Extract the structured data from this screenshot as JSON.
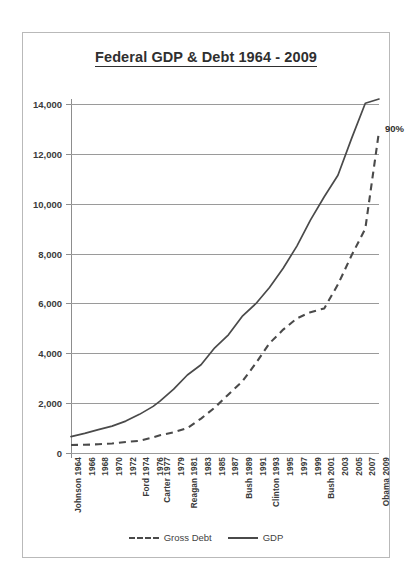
{
  "chart_data": {
    "type": "line",
    "title": "Federal GDP & Debt 1964 - 2009",
    "xlabel": "",
    "ylabel": "",
    "ylim": [
      0,
      14000
    ],
    "yticks": [
      0,
      2000,
      4000,
      6000,
      8000,
      10000,
      12000,
      14000
    ],
    "ytick_labels": [
      "0",
      "2,000",
      "4,000",
      "6,000",
      "8,000",
      "10,000",
      "12,000",
      "14,000"
    ],
    "grid": true,
    "legend_position": "bottom",
    "categories": [
      "Johnson 1964",
      "1966",
      "1968",
      "1970",
      "1972",
      "Ford 1974",
      "1976",
      "Carter 1977",
      "1979",
      "Reagan 1981",
      "1983",
      "1985",
      "1987",
      "Bush 1989",
      "1991",
      "Clinton 1993",
      "1995",
      "1997",
      "1999",
      "Bush 2001",
      "2003",
      "2005",
      "2007",
      "Obama 2009"
    ],
    "x": [
      1964,
      1966,
      1968,
      1970,
      1972,
      1974,
      1976,
      1977,
      1979,
      1981,
      1983,
      1985,
      1987,
      1989,
      1991,
      1993,
      1995,
      1997,
      1999,
      2001,
      2003,
      2005,
      2007,
      2009
    ],
    "series": [
      {
        "name": "Gross Debt",
        "style": "dashed",
        "color": "#4a4a4a",
        "values": [
          320,
          330,
          350,
          380,
          440,
          490,
          630,
          710,
          830,
          1000,
          1380,
          1820,
          2350,
          2860,
          3600,
          4400,
          4950,
          5400,
          5650,
          5800,
          6760,
          7930,
          9000,
          12900
        ]
      },
      {
        "name": "GDP",
        "style": "solid",
        "color": "#4a4a4a",
        "values": [
          660,
          790,
          940,
          1080,
          1280,
          1550,
          1870,
          2080,
          2560,
          3130,
          3540,
          4220,
          4740,
          5480,
          5990,
          6640,
          7410,
          8300,
          9350,
          10280,
          11140,
          12620,
          14030,
          14200
        ]
      }
    ],
    "annotations": [
      {
        "text": "90%",
        "x": 2009,
        "y": 13000,
        "note": "debt-to-GDP ratio at end of series"
      }
    ]
  },
  "legend": {
    "entries": [
      {
        "label": "Gross Debt",
        "style": "dashed"
      },
      {
        "label": "GDP",
        "style": "solid"
      }
    ]
  }
}
